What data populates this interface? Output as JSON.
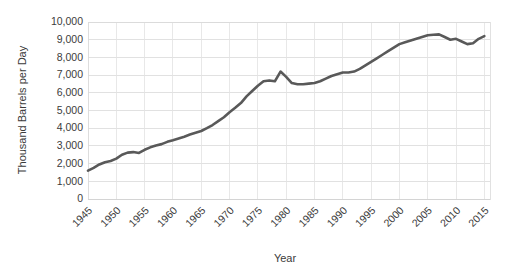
{
  "chart_data": {
    "type": "line",
    "title": "",
    "xlabel": "Year",
    "ylabel": "Thousand Barrels per Day",
    "xlim": [
      1945,
      2016
    ],
    "ylim": [
      0,
      10000
    ],
    "grid": true,
    "legend": null,
    "legend_position": "none",
    "line_color": "#595959",
    "gridline_color": "#d9d9d9",
    "text_color": "#3b3b3b",
    "xticks": [
      "1945",
      "1950",
      "1955",
      "1960",
      "1965",
      "1970",
      "1975",
      "1980",
      "1985",
      "1990",
      "1995",
      "2000",
      "2005",
      "2010",
      "2015"
    ],
    "yticks": [
      "0",
      "1,000",
      "2,000",
      "3,000",
      "4,000",
      "5,000",
      "6,000",
      "7,000",
      "8,000",
      "9,000",
      "10,000"
    ],
    "ytick_values": [
      0,
      1000,
      2000,
      3000,
      4000,
      5000,
      6000,
      7000,
      8000,
      9000,
      10000
    ],
    "series": [
      {
        "name": "Thousand Barrels per Day",
        "x": [
          1945,
          1946,
          1947,
          1948,
          1949,
          1950,
          1951,
          1952,
          1953,
          1954,
          1955,
          1956,
          1957,
          1958,
          1959,
          1960,
          1961,
          1962,
          1963,
          1964,
          1965,
          1966,
          1967,
          1968,
          1969,
          1970,
          1971,
          1972,
          1973,
          1974,
          1975,
          1976,
          1977,
          1978,
          1979,
          1980,
          1981,
          1982,
          1983,
          1984,
          1985,
          1986,
          1987,
          1988,
          1989,
          1990,
          1991,
          1992,
          1993,
          1994,
          1995,
          1996,
          1997,
          1998,
          1999,
          2000,
          2001,
          2002,
          2003,
          2004,
          2005,
          2006,
          2007,
          2008,
          2009,
          2010,
          2011,
          2012,
          2013,
          2014,
          2015
        ],
        "values": [
          1600,
          1760,
          1950,
          2080,
          2150,
          2280,
          2500,
          2620,
          2650,
          2600,
          2780,
          2920,
          3020,
          3100,
          3230,
          3320,
          3420,
          3520,
          3640,
          3740,
          3840,
          4000,
          4180,
          4400,
          4620,
          4900,
          5150,
          5420,
          5800,
          6100,
          6400,
          6650,
          6700,
          6650,
          7200,
          6900,
          6550,
          6480,
          6480,
          6520,
          6550,
          6650,
          6800,
          6950,
          7050,
          7150,
          7150,
          7200,
          7350,
          7550,
          7750,
          7950,
          8150,
          8350,
          8550,
          8750,
          8850,
          8950,
          9050,
          9150,
          9250,
          9280,
          9300,
          9150,
          9000,
          9050,
          8900,
          8750,
          8800,
          9050,
          9200
        ]
      }
    ]
  }
}
